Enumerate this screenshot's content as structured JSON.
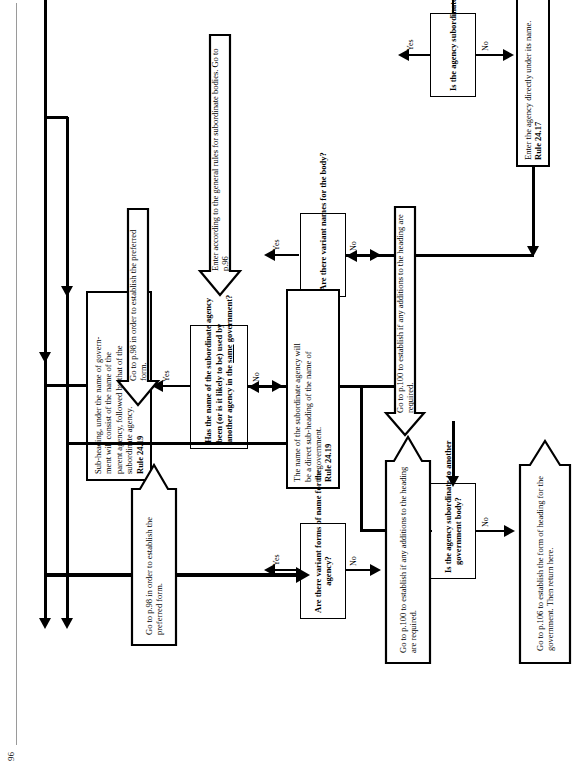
{
  "page": {
    "page_number": "96",
    "orientation": "landscape-rotated"
  },
  "nodes": {
    "q1": {
      "name": "question-agency-subordinate-1",
      "text": "Is the agency subordinate to another government body?",
      "type": "decision"
    },
    "a1_enter_directly": {
      "name": "action-enter-agency-directly",
      "line1": "Enter the agency directly under its name.",
      "rule": "Rule 24.17",
      "type": "action"
    },
    "a1_general_rules": {
      "name": "action-enter-general-rules-subordinate",
      "line1": "Enter according to the general rules for subordinate bodies.",
      "line2": "Go to p.96",
      "type": "arrow-action"
    },
    "q2_variant_names": {
      "name": "question-variant-names-body",
      "text": "Are there variant names for the body?",
      "type": "decision"
    },
    "a2_p98": {
      "name": "action-goto-p98-preferred-form-1",
      "line1": "Go to p.98 in order to establish the",
      "line2": "preferred form.",
      "type": "arrow-action"
    },
    "a2_p100": {
      "name": "action-goto-p100-additions-1",
      "line1": "Go to p.100 to establish if any additions",
      "line2": "to the heading are required.",
      "type": "arrow-action"
    },
    "q3_name_used": {
      "name": "question-name-used-by-another-agency",
      "line1": "Has the name of the subordinate agency",
      "line2": "been (or is it likely to be) used by",
      "line3_pre": "another agency in the ",
      "line3_underlined": "same",
      "line3_post": " government?",
      "type": "decision"
    },
    "a3_subheading_parent": {
      "name": "action-subheading-parent-agency",
      "line1": "Sub-heading, under the name of govern-",
      "line2": "ment will consist of the name of the",
      "line3": "parent agency, followed by that of the",
      "line4": "subordinate agency.",
      "rule": "Rule 24.19",
      "type": "action"
    },
    "a3_direct_subheading": {
      "name": "action-direct-subheading-government",
      "line1": "The name of the subordinate agency will",
      "line2": "be a direct sub-heading of the name of",
      "line3": "the government.",
      "rule": "Rule 24.19",
      "type": "action"
    },
    "q4_agency_subordinate_2": {
      "name": "question-agency-subordinate-2",
      "line1": "Is the agency subordinate to another",
      "line2": "government body?",
      "type": "decision"
    },
    "a4_p106": {
      "name": "action-goto-p106-government-form",
      "line1": "Go to p.106 to establish the form of",
      "line2": "heading for the government. Then return",
      "line3": "here.",
      "type": "arrow-action"
    },
    "q5_variant_forms": {
      "name": "question-variant-forms-agency",
      "line1": "Are there variant forms of name for the",
      "line2": "agency?",
      "type": "decision"
    },
    "a5_p98": {
      "name": "action-goto-p98-preferred-form-2",
      "line1": "Go to p.98 in order to establish",
      "line2": "the preferred form.",
      "type": "arrow-action"
    },
    "a5_p100": {
      "name": "action-goto-p100-additions-2",
      "line1": "Go to p.100 to establish if any additions",
      "line2": "to the heading are required.",
      "type": "arrow-action"
    }
  },
  "edge_labels": {
    "yes1": "Yes",
    "no1": "No",
    "yes2": "Yes",
    "no2": "No",
    "yes3": "Yes",
    "no3": "No",
    "yes4": "Yes",
    "no4": "No",
    "yes5": "Yes",
    "no5": "No"
  },
  "colors": {
    "ink": "#000000",
    "paper": "#ffffff"
  }
}
